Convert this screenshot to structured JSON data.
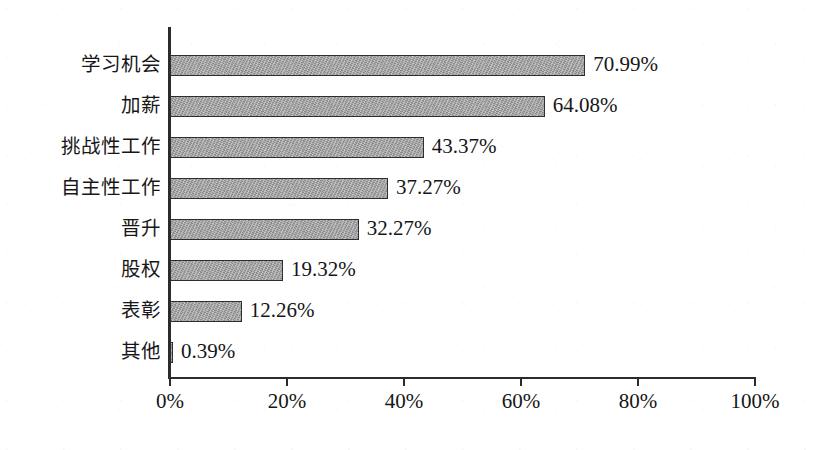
{
  "chart_data": {
    "type": "bar",
    "orientation": "horizontal",
    "title": "",
    "subtitle": "",
    "xlabel": "",
    "ylabel": "",
    "categories": [
      "学习机会",
      "加薪",
      "挑战性工作",
      "自主性工作",
      "晋升",
      "股权",
      "表彰",
      "其他"
    ],
    "values": [
      70.99,
      64.08,
      43.37,
      37.27,
      32.27,
      19.32,
      12.26,
      0.39
    ],
    "value_labels": [
      "70.99%",
      "64.08%",
      "43.37%",
      "37.27%",
      "32.27%",
      "19.32%",
      "12.26%",
      "0.39%"
    ],
    "xlim": [
      0,
      100
    ],
    "x_tick_values": [
      0,
      20,
      40,
      60,
      80,
      100
    ],
    "x_tick_labels": [
      "0%",
      "20%",
      "40%",
      "60%",
      "80%",
      "100%"
    ],
    "grid": false,
    "legend": false,
    "legend_position": "none",
    "bar_fill_color": "#9c9c9c",
    "bar_border_color": "#2e2e2e",
    "axis_color": "#2b2b2b",
    "background_color": "#ffffff",
    "text_color": "#161616"
  }
}
